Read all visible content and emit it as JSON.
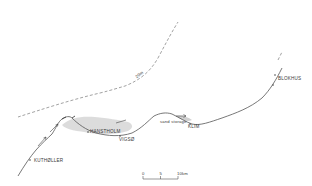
{
  "map": {
    "type": "coastal sketch map",
    "colors": {
      "line": "#555555",
      "contour": "#777777",
      "sand": "#bdbdbd",
      "text": "#3a3a3a",
      "background": "#ffffff"
    },
    "places": [
      {
        "name": "HANSTHOLM",
        "x": 90,
        "y": 133
      },
      {
        "name": "VIGSØ",
        "x": 122,
        "y": 139
      },
      {
        "name": "KLIM",
        "x": 193,
        "y": 127
      },
      {
        "name": "BLOKHUS",
        "x": 281,
        "y": 79
      },
      {
        "name": "KUTHØLLER",
        "x": 41,
        "y": 154
      }
    ],
    "annotations": {
      "sand_storage": "sand storage",
      "contour_label": "20m"
    },
    "scale_bar": {
      "ticks": [
        "0",
        "5",
        "10km"
      ]
    }
  }
}
